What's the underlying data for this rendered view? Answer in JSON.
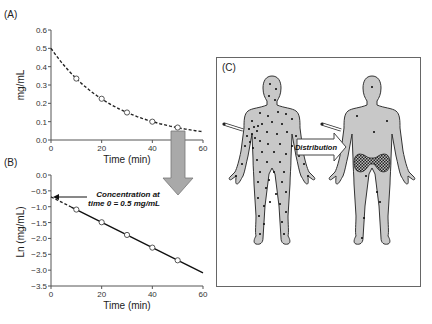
{
  "panels": {
    "a": {
      "label": "(A)"
    },
    "b": {
      "label": "(B)"
    },
    "c": {
      "label": "(C)",
      "arrow_label": "Distribution"
    }
  },
  "annotation": {
    "line1": "Concentration at",
    "line2": "time 0 = 0.5 mg/mL"
  },
  "colors": {
    "body_fill": "#c8c8c8",
    "arrow_fill": "#a9a9a9",
    "line": "#222222"
  },
  "chart_data": [
    {
      "type": "line",
      "title": "(A)",
      "xlabel": "Time (min)",
      "ylabel": "mg/mL",
      "xlim": [
        0,
        60
      ],
      "ylim": [
        0.0,
        0.6
      ],
      "xticks": [
        "0",
        "20",
        "40",
        "60"
      ],
      "yticks": [
        "0.0",
        "0.1",
        "0.2",
        "0.3",
        "0.4",
        "0.5",
        "0.6"
      ],
      "series": [
        {
          "name": "observed",
          "style": "open-circle markers",
          "x": [
            10,
            20,
            30,
            40,
            50
          ],
          "values": [
            0.335,
            0.225,
            0.15,
            0.1,
            0.068
          ]
        },
        {
          "name": "fit",
          "style": "dashed curve",
          "x": [
            0,
            10,
            20,
            30,
            40,
            50,
            60
          ],
          "values": [
            0.5,
            0.335,
            0.225,
            0.15,
            0.1,
            0.068,
            0.045
          ]
        }
      ],
      "grid": false
    },
    {
      "type": "line",
      "title": "(B)",
      "xlabel": "Time (min)",
      "ylabel": "Ln (mg/mL)",
      "xlim": [
        0,
        60
      ],
      "ylim": [
        -3.5,
        0.0
      ],
      "xticks": [
        "0",
        "20",
        "40",
        "60"
      ],
      "yticks": [
        "0.0",
        "-0.5",
        "-1.0",
        "-1.5",
        "-2.0",
        "-2.5",
        "-3.0",
        "-3.5"
      ],
      "series": [
        {
          "name": "observed",
          "style": "open-circle markers",
          "x": [
            10,
            20,
            30,
            40,
            50
          ],
          "values": [
            -1.09,
            -1.49,
            -1.89,
            -2.29,
            -2.69
          ]
        },
        {
          "name": "fit",
          "style": "solid line (dashed extrapolation to t=0)",
          "x": [
            0,
            60
          ],
          "values": [
            -0.69,
            -3.09
          ]
        }
      ],
      "annotations": [
        "Concentration at time 0 = 0.5 mg/mL"
      ],
      "grid": false
    }
  ]
}
